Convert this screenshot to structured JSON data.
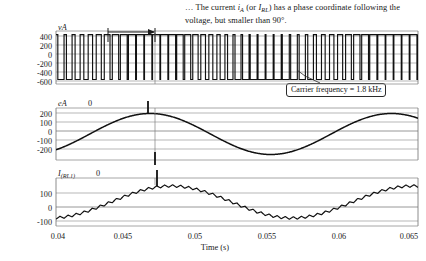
{
  "figure": {
    "caption": {
      "prefix": "… The current ",
      "i_symbol": "i",
      "i_sub": "A",
      "mid1": " (or ",
      "irl_symbol": "I",
      "irl_sub": "RL",
      "mid2": ") has a phase coordinate following the voltage, but smaller than 90°."
    },
    "callout": {
      "label": "Carrier frequency = 1.8 kHz"
    },
    "xlabel": "Time (s)",
    "xticks": [
      "0.04",
      "0.045",
      "0.05",
      "0.055",
      "0.06",
      "0.065"
    ],
    "panels": [
      {
        "name": "pwm-voltage",
        "title": "vA",
        "zero_marker": "",
        "yticks": [
          "400",
          "200",
          "0",
          "-200",
          "-400",
          "-600"
        ]
      },
      {
        "name": "reference-voltage",
        "title": "eA",
        "zero_marker": "0",
        "yticks": [
          "200",
          "100",
          "0",
          "-100",
          "-200"
        ]
      },
      {
        "name": "load-current",
        "title_main": "I",
        "title_sub": "(RL1)",
        "zero_marker": "0",
        "yticks": [
          "100",
          "0",
          "-100"
        ]
      }
    ],
    "colors": {
      "trace": "#111111",
      "grid": "#9a9a9a",
      "frame": "#555555",
      "background": "#ffffff"
    },
    "annotation": {
      "name": "period-span-arrow"
    }
  },
  "chart_data": [
    {
      "type": "line",
      "name": "pwm-voltage",
      "title": "vA",
      "xlabel": "Time (s)",
      "ylabel": "vA",
      "xlim": [
        0.04,
        0.065
      ],
      "ylim": [
        -700,
        480
      ],
      "yticks": [
        400,
        200,
        0,
        -200,
        -400,
        -600
      ],
      "xticks": [
        0.04,
        0.045,
        0.05,
        0.055,
        0.06,
        0.065
      ],
      "grid": true,
      "description": "PWM switched phase voltage: rectangular pulses alternating between about +400 V and -600 V at a 1.8 kHz carrier, with sinusoidally varying duty cycle",
      "carrier_frequency_hz": 1800,
      "high_level": 400,
      "low_level": -600
    },
    {
      "type": "line",
      "name": "reference-voltage",
      "title": "eA",
      "xlabel": "Time (s)",
      "ylabel": "eA",
      "xlim": [
        0.04,
        0.065
      ],
      "ylim": [
        -260,
        260
      ],
      "yticks": [
        200,
        100,
        0,
        -100,
        -200
      ],
      "xticks": [
        0.04,
        0.045,
        0.05,
        0.055,
        0.06,
        0.065
      ],
      "grid": true,
      "x": [
        0.04,
        0.0415,
        0.043,
        0.0445,
        0.0465,
        0.048,
        0.0495,
        0.051,
        0.0525,
        0.054,
        0.0555,
        0.057,
        0.0585,
        0.06,
        0.0615,
        0.063,
        0.0645,
        0.065
      ],
      "values": [
        -105,
        -20,
        80,
        160,
        205,
        200,
        170,
        115,
        40,
        -45,
        -125,
        -185,
        -205,
        -190,
        -140,
        -60,
        55,
        130
      ],
      "fundamental_frequency_hz": 60,
      "amplitude": 205
    },
    {
      "type": "line",
      "name": "load-current",
      "title": "I(RL1)",
      "xlabel": "Time (s)",
      "ylabel": "I(RL1)",
      "xlim": [
        0.04,
        0.065
      ],
      "ylim": [
        -150,
        150
      ],
      "yticks": [
        100,
        0,
        -100
      ],
      "xticks": [
        0.04,
        0.045,
        0.05,
        0.055,
        0.06,
        0.065
      ],
      "grid": true,
      "x": [
        0.04,
        0.0415,
        0.043,
        0.0445,
        0.0465,
        0.048,
        0.0495,
        0.051,
        0.0525,
        0.054,
        0.0555,
        0.057,
        0.0585,
        0.06,
        0.0615,
        0.063,
        0.0645,
        0.065
      ],
      "values": [
        -62,
        -20,
        25,
        62,
        85,
        88,
        80,
        62,
        32,
        -5,
        -45,
        -80,
        -100,
        -110,
        -105,
        -80,
        -30,
        30
      ],
      "description": "Load current with PWM ripple superimposed on a 60 Hz fundamental, lagging the reference voltage by less than 90 degrees",
      "ripple_amplitude": 8
    }
  ]
}
